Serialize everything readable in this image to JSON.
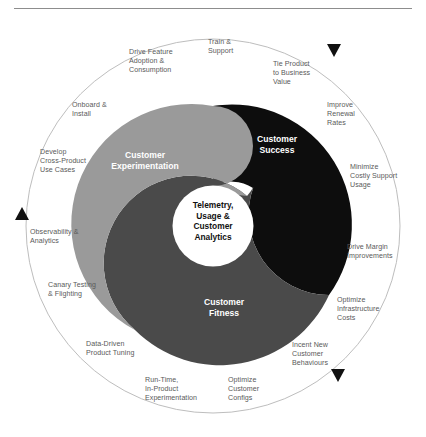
{
  "figure": {
    "title_rule": "horizontal-rule",
    "core": {
      "label": "Telemetry,\nUsage &\nCustomer\nAnalytics"
    },
    "segments": [
      {
        "name": "customer-success",
        "label": "Customer\nSuccess",
        "color": "#0d0d0d"
      },
      {
        "name": "customer-experimentation",
        "label": "Customer\nExperimentation",
        "color": "#9a9a9a"
      },
      {
        "name": "customer-fitness",
        "label": "Customer\nFitness",
        "color": "#4a4a4a"
      }
    ],
    "outer_ring": {
      "stroke": "#b5b5b5",
      "markers": 3
    },
    "outer_labels": [
      {
        "name": "train-and-support",
        "text": "Train &\nSupport"
      },
      {
        "name": "drive-feature-adoption",
        "text": "Drive Feature\nAdoption &\nConsumption"
      },
      {
        "name": "tie-product-to-business",
        "text": "Tie Product\nto Business\nValue"
      },
      {
        "name": "improve-renewal-rates",
        "text": "Improve\nRenewal\nRates"
      },
      {
        "name": "onboard-and-install",
        "text": "Onboard &\nInstall"
      },
      {
        "name": "minimize-costly-support",
        "text": "Minimize\nCostly Support\nUsage"
      },
      {
        "name": "develop-cross-product",
        "text": "Develop\nCross-Product\nUse Cases"
      },
      {
        "name": "drive-margin-improvements",
        "text": "Drive Margin\nImprovements"
      },
      {
        "name": "observability-analytics",
        "text": "Observability &\nAnalytics"
      },
      {
        "name": "canary-testing-flighting",
        "text": "Canary Testing\n& Flighting"
      },
      {
        "name": "optimize-infrastructure",
        "text": "Optimize\nInfrastructure\nCosts"
      },
      {
        "name": "data-driven-product-tuning",
        "text": "Data-Driven\nProduct Tuning"
      },
      {
        "name": "incent-new-customer",
        "text": "Incent New\nCustomer\nBehaviours"
      },
      {
        "name": "run-time-in-product",
        "text": "Run-Time,\nIn-Product\nExperimentation"
      },
      {
        "name": "optimize-customer-configs",
        "text": "Optimize\nCustomer\nConfigs"
      }
    ]
  }
}
